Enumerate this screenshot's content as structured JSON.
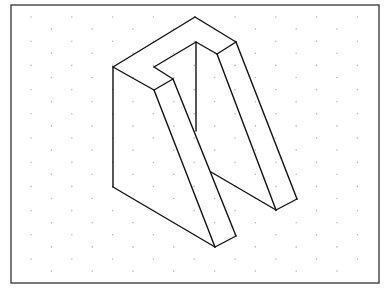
{
  "drawing": {
    "type": "isometric-view",
    "subject": "U-shaped notched block (isometric sketch on dot grid)",
    "frame": {
      "x": 11,
      "y": 5,
      "width": 368,
      "height": 278,
      "color": "#333333"
    },
    "grid": {
      "style": "isometric-dots",
      "dot_color": "#b8b8b8",
      "start_x": 31,
      "start_y": 17,
      "col_spacing": 40.8,
      "row_spacing": 12.1,
      "odd_row_offset": 20.4,
      "rows": 22
    },
    "line_color": "#111111",
    "vertices": {
      "A_top": [
        195,
        17
      ],
      "B_left": [
        113,
        67
      ],
      "C_front_top": [
        154,
        90
      ],
      "D_notch_front": [
        173,
        79
      ],
      "E_notch_left": [
        154,
        67
      ],
      "F_notch_back": [
        196,
        42
      ],
      "G_notch_right": [
        217,
        54
      ],
      "H_right_top": [
        236,
        42
      ],
      "I_left_bottom": [
        113,
        187
      ],
      "J_bottom": [
        215,
        247
      ],
      "K_left_leg_right": [
        236,
        236
      ],
      "L_crotch": [
        211,
        172
      ],
      "M_inner_vertical_end": [
        196,
        131
      ],
      "N_right_leg_bottom": [
        276,
        210
      ],
      "O_right_leg_right": [
        297,
        199
      ]
    },
    "edges": [
      [
        "A_top",
        "B_left"
      ],
      [
        "A_top",
        "H_right_top"
      ],
      [
        "B_left",
        "C_front_top"
      ],
      [
        "C_front_top",
        "D_notch_front"
      ],
      [
        "D_notch_front",
        "E_notch_left"
      ],
      [
        "E_notch_left",
        "F_notch_back"
      ],
      [
        "F_notch_back",
        "G_notch_right"
      ],
      [
        "G_notch_right",
        "H_right_top"
      ],
      [
        "B_left",
        "I_left_bottom"
      ],
      [
        "I_left_bottom",
        "J_bottom"
      ],
      [
        "C_front_top",
        "J_bottom"
      ],
      [
        "D_notch_front",
        "K_left_leg_right"
      ],
      [
        "J_bottom",
        "K_left_leg_right"
      ],
      [
        "F_notch_back",
        "M_inner_vertical_end"
      ],
      [
        "L_crotch",
        "N_right_leg_bottom"
      ],
      [
        "G_notch_right",
        "N_right_leg_bottom"
      ],
      [
        "H_right_top",
        "O_right_leg_right"
      ],
      [
        "N_right_leg_bottom",
        "O_right_leg_right"
      ]
    ]
  }
}
